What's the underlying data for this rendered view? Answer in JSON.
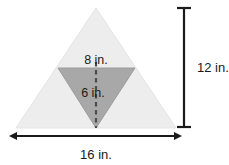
{
  "figure": {
    "type": "geometry-diagram",
    "background_color": "#ffffff",
    "outer_triangle": {
      "name": "outer-triangle",
      "fill_color": "#ededed",
      "stroke_color": "#e2e2e2",
      "base_length_label": "16 in.",
      "height_label": "12 in.",
      "points": "96,8 176,128 16,128"
    },
    "inner_triangle": {
      "name": "inner-shaded-triangle",
      "fill_color": "#a8a8a8",
      "stroke_color": "#9a9a9a",
      "orientation": "inverted",
      "base_length_label": "8 in.",
      "height_label": "6 in.",
      "points": "58,68 135,68 96,128"
    },
    "dashed_height_line": {
      "name": "inner-height-dashed-line",
      "color": "#4d4d4d",
      "x": 96,
      "y_start": 62,
      "y_end": 128
    },
    "labels": {
      "inner_base": "8 in.",
      "inner_height": "6 in.",
      "outer_height": "12 in.",
      "outer_base": "16 in."
    },
    "dimension_lines": {
      "vertical": {
        "name": "vertical-dimension-line",
        "color": "#1a1a1a",
        "x": 184,
        "y_top": 7,
        "y_bottom": 128,
        "cap_style": "serif",
        "label": "12 in."
      },
      "horizontal": {
        "name": "horizontal-dimension-line",
        "color": "#1a1a1a",
        "y": 136,
        "x_left": 16,
        "x_right": 176,
        "cap_style": "double-arrow",
        "label": "16 in."
      }
    }
  }
}
